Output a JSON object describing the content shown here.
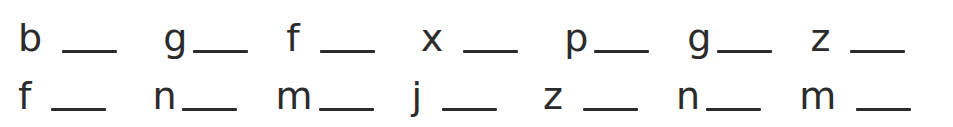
{
  "worksheet": {
    "type": "handwriting-blank-worksheet",
    "text_color": "#2b2b2b",
    "background_color": "#ffffff",
    "rows": [
      {
        "name": "top-row",
        "items": [
          {
            "letter": "b",
            "blank": "__",
            "gap": "wide"
          },
          {
            "letter": "g",
            "blank": "__",
            "gap": "narrow"
          },
          {
            "letter": "f",
            "blank": "__",
            "gap": "wide"
          },
          {
            "letter": "x",
            "blank": "__",
            "gap": "wide"
          },
          {
            "letter": "p",
            "blank": "__",
            "gap": "narrow"
          },
          {
            "letter": "g",
            "blank": "__",
            "gap": "narrow"
          },
          {
            "letter": "z",
            "blank": "__",
            "gap": "wide"
          }
        ]
      },
      {
        "name": "bottom-row",
        "items": [
          {
            "letter": "f",
            "blank": "__",
            "gap": "wide"
          },
          {
            "letter": "n",
            "blank": "__",
            "gap": "narrow"
          },
          {
            "letter": "m",
            "blank": "__",
            "gap": "narrow"
          },
          {
            "letter": "j",
            "blank": "__",
            "gap": "wide"
          },
          {
            "letter": "z",
            "blank": "__",
            "gap": "wide"
          },
          {
            "letter": "n",
            "blank": "__",
            "gap": "narrow"
          },
          {
            "letter": "m",
            "blank": "__",
            "gap": "wide"
          }
        ]
      }
    ]
  }
}
